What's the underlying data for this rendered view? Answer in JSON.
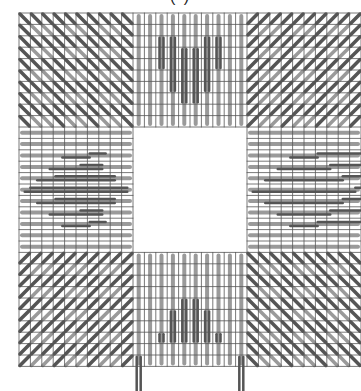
{
  "title": "(          )",
  "pattern": {
    "name": "needlepoint stitch chart",
    "grid": {
      "origin_x": 19,
      "origin_y": 13,
      "cell": 11.4,
      "cols": 30,
      "rows": 31,
      "line_color": "#555555"
    },
    "colors": {
      "light_stitch": "#9a9a9a",
      "dark_stitch": "#555555",
      "background": "#ffffff"
    },
    "blocks": [
      {
        "id": "top-left",
        "stitch": "diagonal-backslash"
      },
      {
        "id": "top-center",
        "stitch": "vertical",
        "motif": "heart"
      },
      {
        "id": "top-right",
        "stitch": "diagonal-slash"
      },
      {
        "id": "middle-left",
        "stitch": "horizontal",
        "motif": "diamond"
      },
      {
        "id": "center",
        "stitch": "none"
      },
      {
        "id": "middle-right",
        "stitch": "horizontal",
        "motif": "diamond"
      },
      {
        "id": "bottom-left",
        "stitch": "diagonal-slash"
      },
      {
        "id": "bottom-center",
        "stitch": "vertical",
        "motif": "inverted-heart"
      },
      {
        "id": "bottom-right",
        "stitch": "diagonal-backslash"
      }
    ]
  }
}
